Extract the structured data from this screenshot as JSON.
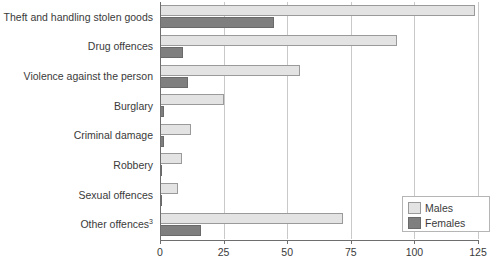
{
  "chart_data": {
    "type": "bar",
    "orientation": "horizontal",
    "title": "",
    "subtitle": "",
    "xlabel": "",
    "ylabel": "",
    "xlim": [
      0,
      125
    ],
    "xticks": [
      0,
      25,
      50,
      75,
      100,
      125
    ],
    "xtick_labels": [
      "0",
      "25",
      "50",
      "75",
      "100",
      "125"
    ],
    "grid": true,
    "grid_axis": "x",
    "legend_position": "lower-right",
    "categories": [
      "Theft and handling stolen goods",
      "Drug offences",
      "Violence against the person",
      "Burglary",
      "Criminal damage",
      "Robbery",
      "Sexual offences",
      "Other offences"
    ],
    "category_footnotes": [
      "",
      "",
      "",
      "",
      "",
      "",
      "",
      "3"
    ],
    "series": [
      {
        "name": "Males",
        "color": "#e3e3e3",
        "values": [
          124,
          93,
          55,
          25,
          12,
          8.5,
          7,
          72
        ]
      },
      {
        "name": "Females",
        "color": "#7f7f7f",
        "values": [
          45,
          9,
          11,
          1.5,
          1.5,
          0.6,
          0.3,
          16
        ]
      }
    ]
  },
  "legend": {
    "entries": [
      {
        "label": "Males",
        "color": "#e3e3e3"
      },
      {
        "label": "Females",
        "color": "#7f7f7f"
      }
    ]
  }
}
